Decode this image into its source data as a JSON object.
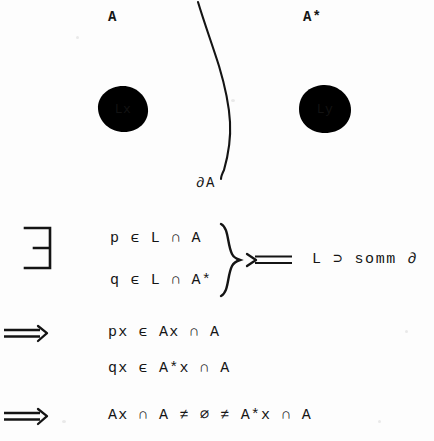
{
  "document": {
    "type": "handwritten-mathematical-proof-scan",
    "background_color": "#fdfdfd",
    "ink_color": "#141414"
  },
  "diagram": {
    "label_left": "A",
    "label_right": "A*",
    "boundary_label": "∂A",
    "left_circle_label": "Lx",
    "right_circle_label": "Ly",
    "curve_name": "boundary-curve"
  },
  "proof": {
    "quantifier_symbol": "∃",
    "implies_symbol": "⟹",
    "implied_by_symbol": "⟸",
    "lines": [
      {
        "id": "line-1",
        "text": "p ϵ L ∩ A"
      },
      {
        "id": "line-2",
        "text": "q ϵ L ∩ A*"
      },
      {
        "id": "line-3",
        "text": "px ϵ Ax ∩ A"
      },
      {
        "id": "line-4",
        "text": "qx ϵ A*x ∩ A"
      },
      {
        "id": "line-5",
        "text": "Ax ∩ A ≠ ∅ ≠ A*x ∩ A"
      }
    ],
    "annotation": "L ⊃ somm ∂",
    "brace_symbol": "}"
  }
}
